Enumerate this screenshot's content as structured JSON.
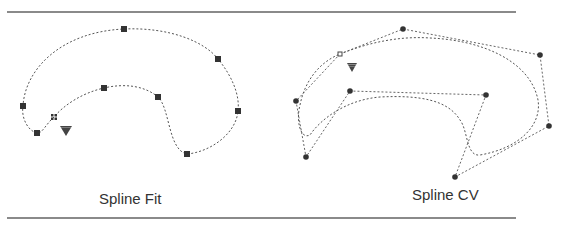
{
  "figure": {
    "panels": [
      {
        "id": "spline-fit",
        "label": "Spline Fit",
        "markers": "square fit points",
        "fit_points": [
          [
            54,
            117
          ],
          [
            37,
            133
          ],
          [
            23,
            106
          ],
          [
            124,
            29
          ],
          [
            218,
            59
          ],
          [
            238,
            111
          ],
          [
            187,
            154
          ],
          [
            158,
            97
          ],
          [
            104,
            88
          ]
        ],
        "start_marker": "grid-square",
        "direction_marker": "triangle-down",
        "triangle": [
          66,
          131
        ]
      },
      {
        "id": "spline-cv",
        "label": "Spline CV",
        "markers": "round control vertices",
        "control_vertices": [
          [
            340,
            54
          ],
          [
            403,
            29
          ],
          [
            540,
            55
          ],
          [
            549,
            126
          ],
          [
            455,
            177
          ],
          [
            486,
            95
          ],
          [
            350,
            91
          ],
          [
            306,
            157
          ],
          [
            296,
            101
          ]
        ],
        "start_marker": "open-square",
        "direction_marker": "triangle-down",
        "triangle": [
          352,
          67
        ]
      }
    ],
    "colors": {
      "rule": "#8a8a8a",
      "curve": "#555555",
      "marker": "#333333",
      "text": "#333333"
    }
  }
}
